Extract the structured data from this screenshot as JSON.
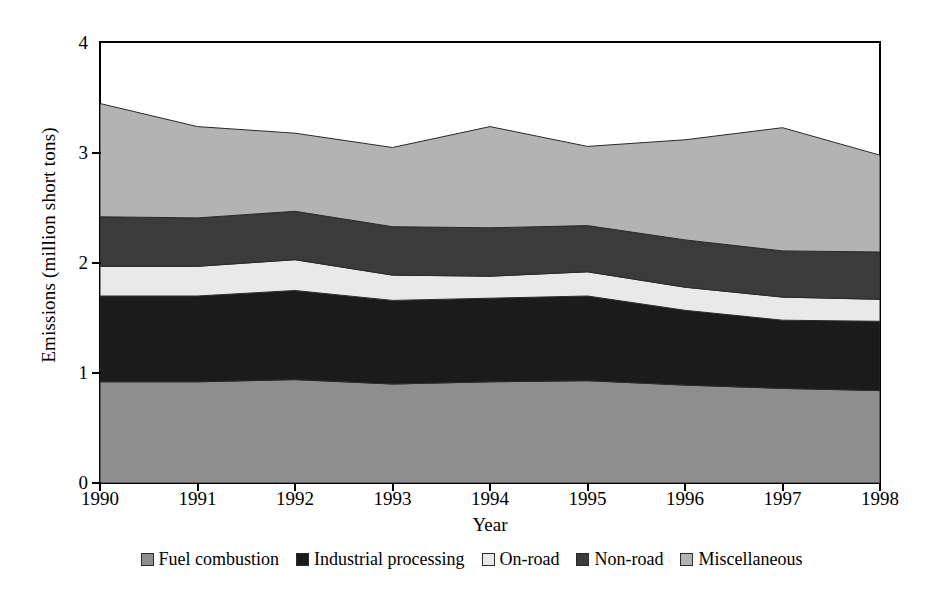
{
  "chart_data": {
    "type": "area",
    "stacked": true,
    "title": "",
    "xlabel": "Year",
    "ylabel": "Emissions (million short tons)",
    "categories": [
      "1990",
      "1991",
      "1992",
      "1993",
      "1994",
      "1995",
      "1996",
      "1997",
      "1998"
    ],
    "x": [
      1990,
      1991,
      1992,
      1993,
      1994,
      1995,
      1996,
      1997,
      1998
    ],
    "xlim": [
      1990,
      1998
    ],
    "ylim": [
      0,
      4
    ],
    "ytick_labels": [
      "0",
      "1",
      "2",
      "3",
      "4"
    ],
    "yticks": [
      0,
      1,
      2,
      3,
      4
    ],
    "grid": false,
    "legend_position": "bottom",
    "series": [
      {
        "name": "Fuel combustion",
        "color": "#8e8e8e",
        "values": [
          0.92,
          0.92,
          0.94,
          0.9,
          0.92,
          0.93,
          0.89,
          0.86,
          0.84
        ]
      },
      {
        "name": "Industrial processing",
        "color": "#1b1b1b",
        "values": [
          0.78,
          0.78,
          0.81,
          0.76,
          0.76,
          0.77,
          0.68,
          0.62,
          0.63
        ]
      },
      {
        "name": "On-road",
        "color": "#e9e9e9",
        "values": [
          0.27,
          0.27,
          0.28,
          0.23,
          0.2,
          0.22,
          0.21,
          0.21,
          0.2
        ]
      },
      {
        "name": "Non-road",
        "color": "#3b3b3b",
        "values": [
          0.45,
          0.44,
          0.44,
          0.44,
          0.44,
          0.42,
          0.43,
          0.42,
          0.43
        ]
      },
      {
        "name": "Miscellaneous",
        "color": "#b3b3b3",
        "values": [
          1.03,
          0.83,
          0.71,
          0.72,
          0.92,
          0.72,
          0.91,
          1.12,
          0.88
        ]
      }
    ],
    "cumulative_tops": {
      "1990": [
        0.92,
        1.7,
        1.97,
        2.42,
        3.45
      ],
      "1991": [
        0.92,
        1.7,
        1.97,
        2.41,
        3.24
      ],
      "1992": [
        0.94,
        1.75,
        2.03,
        2.47,
        3.18
      ],
      "1993": [
        0.9,
        1.66,
        1.89,
        2.33,
        3.05
      ],
      "1994": [
        0.92,
        1.68,
        1.88,
        2.32,
        3.24
      ],
      "1995": [
        0.93,
        1.7,
        1.92,
        2.34,
        3.06
      ],
      "1996": [
        0.89,
        1.57,
        1.78,
        2.21,
        3.12
      ],
      "1997": [
        0.86,
        1.48,
        1.69,
        2.11,
        3.23
      ],
      "1998": [
        0.84,
        1.47,
        1.67,
        2.1,
        2.98
      ]
    }
  },
  "legend": {
    "items": [
      {
        "label": "Fuel combustion",
        "color": "#8e8e8e"
      },
      {
        "label": "Industrial processing",
        "color": "#1b1b1b"
      },
      {
        "label": "On-road",
        "color": "#e9e9e9"
      },
      {
        "label": "Non-road",
        "color": "#3b3b3b"
      },
      {
        "label": "Miscellaneous",
        "color": "#b3b3b3"
      }
    ]
  }
}
